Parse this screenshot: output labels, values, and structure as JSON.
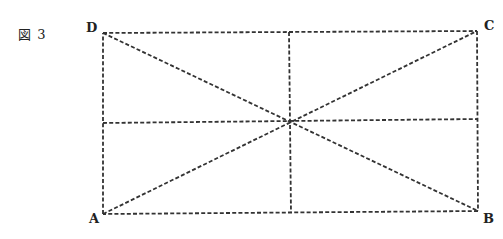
{
  "figure": {
    "label": "図 3"
  },
  "vertices": {
    "A": {
      "label": "A",
      "x": 103,
      "y": 214,
      "label_x": 89,
      "label_y": 212
    },
    "B": {
      "label": "B",
      "x": 478,
      "y": 211,
      "label_x": 483,
      "label_y": 212
    },
    "C": {
      "label": "C",
      "x": 477,
      "y": 31,
      "label_x": 484,
      "label_y": 19
    },
    "D": {
      "label": "D",
      "x": 103,
      "y": 33,
      "label_x": 86,
      "label_y": 21
    }
  },
  "segments": [
    {
      "name": "side-DC",
      "from": "D",
      "to": "C"
    },
    {
      "name": "side-CB",
      "from": "C",
      "to": "B"
    },
    {
      "name": "side-BA",
      "from": "B",
      "to": "A"
    },
    {
      "name": "side-AD",
      "from": "A",
      "to": "D"
    },
    {
      "name": "diagonal-AC",
      "from": "A",
      "to": "C"
    },
    {
      "name": "diagonal-DB",
      "from": "D",
      "to": "B"
    },
    {
      "name": "midline-horizontal",
      "x1": 103,
      "y1": 123,
      "x2": 478,
      "y2": 119
    },
    {
      "name": "midline-vertical",
      "x1": 289,
      "y1": 32,
      "x2": 291,
      "y2": 213
    }
  ],
  "style": {
    "line_color": "#333333",
    "line_style": "dashed"
  }
}
